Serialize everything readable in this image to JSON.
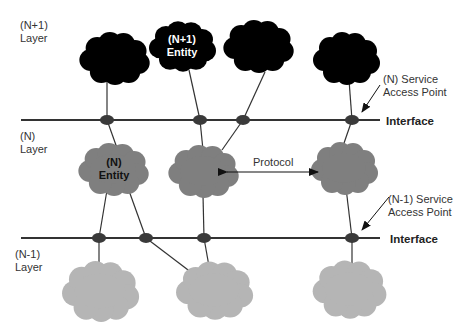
{
  "diagram": {
    "type": "OSI layer service model",
    "layers": [
      {
        "name": "n_plus_1",
        "label_line1": "(N+1)",
        "label_line2": "Layer"
      },
      {
        "name": "n",
        "label_line1": "(N)",
        "label_line2": "Layer"
      },
      {
        "name": "n_minus_1",
        "label_line1": "(N-1)",
        "label_line2": "Layer"
      }
    ],
    "entities": {
      "n_plus_1_entity": {
        "line1": "(N+1)",
        "line2": "Entity"
      },
      "n_entity": {
        "line1": "(N)",
        "line2": "Entity"
      }
    },
    "interfaces": [
      {
        "label": "Interface"
      },
      {
        "label": "Interface"
      }
    ],
    "service_access_points": [
      {
        "line1": "(N) Service",
        "line2": "Access Point"
      },
      {
        "line1": "(N-1) Service",
        "line2": "Access Point"
      }
    ],
    "protocol_label": "Protocol",
    "colors": {
      "n_plus_1_cloud": "#000000",
      "n_cloud": "#7f7f7f",
      "n_minus_1_cloud": "#b5b5b5",
      "line": "#333333",
      "sap": "#3a3a3a"
    }
  }
}
